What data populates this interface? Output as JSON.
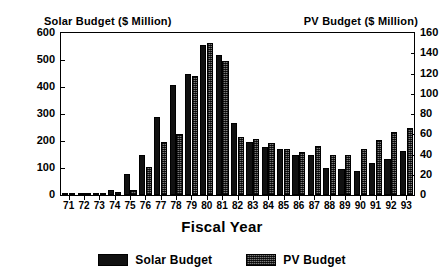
{
  "chart_data": {
    "type": "bar",
    "title": "",
    "xlabel": "Fiscal Year",
    "left_axis_title": "Solar Budget ($ Million)",
    "right_axis_title": "PV Budget ($ Million)",
    "grid": false,
    "legend_position": "bottom",
    "categories": [
      "71",
      "72",
      "73",
      "74",
      "75",
      "76",
      "77",
      "78",
      "79",
      "80",
      "81",
      "82",
      "83",
      "84",
      "85",
      "86",
      "87",
      "88",
      "89",
      "90",
      "91",
      "92",
      "93"
    ],
    "left_ylim": [
      0,
      600
    ],
    "left_yticks": [
      0,
      100,
      200,
      300,
      400,
      500,
      600
    ],
    "left_ytick_labels": [
      "0",
      "100",
      "200",
      "300",
      "400",
      "500",
      "600"
    ],
    "right_ylim": [
      0,
      160
    ],
    "right_yticks": [
      0,
      20,
      40,
      60,
      80,
      100,
      120,
      140,
      160
    ],
    "right_ytick_labels": [
      "0",
      "20",
      "40",
      "60",
      "80",
      "100",
      "120",
      "140",
      "160"
    ],
    "series": [
      {
        "name": "Solar Budget",
        "axis": "left",
        "units": "$ Million",
        "fill": "solid-black",
        "values": [
          2,
          4,
          6,
          18,
          78,
          148,
          288,
          408,
          450,
          557,
          520,
          268,
          198,
          178,
          172,
          150,
          148,
          100,
          98,
          88,
          118,
          132,
          162
        ]
      },
      {
        "name": "PV Budget",
        "axis": "right",
        "units": "$ Million",
        "fill": "hatched-gray",
        "values": [
          0.5,
          1,
          1.5,
          3,
          5,
          28,
          52,
          60,
          118,
          150,
          132,
          57,
          55,
          51,
          45,
          42,
          48,
          40,
          40,
          45,
          54,
          62,
          66
        ]
      }
    ]
  },
  "legend": {
    "entries": [
      {
        "label": "Solar Budget",
        "swatch": "solid-black"
      },
      {
        "label": "PV Budget",
        "swatch": "hatched-gray"
      }
    ]
  },
  "colors": {
    "solar": "#111111",
    "pv": "#7a7a7a",
    "axis": "#000000",
    "background": "#ffffff"
  }
}
